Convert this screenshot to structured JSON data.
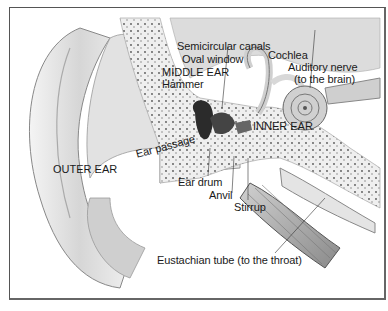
{
  "diagram": {
    "regions": {
      "outer_ear": "OUTER EAR",
      "middle_ear": "MIDDLE EAR",
      "inner_ear": "INNER EAR"
    },
    "labels": {
      "semicircular_canals": "Semicircular canals",
      "cochlea": "Cochlea",
      "oval_window": "Oval window",
      "auditory_nerve": "Auditory nerve",
      "auditory_nerve_note": "(to the brain)",
      "hammer": "Hammer",
      "ear_passage": "Ear passage",
      "ear_drum": "Ear drum",
      "anvil": "Anvil",
      "stirrup": "Stirrup",
      "eustachian_tube": "Eustachian tube (to the throat)"
    },
    "colors": {
      "ink": "#1a1a1a",
      "bone": "#e8e8e8",
      "tissue": "#bdbdbd",
      "shadow": "#6e6e6e",
      "frame": "#555555"
    }
  }
}
